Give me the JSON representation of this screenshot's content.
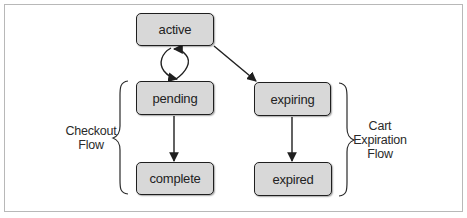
{
  "diagram": {
    "type": "state-flow",
    "colors": {
      "node_fill": "#d8d8d8",
      "node_border": "#1f1f1f",
      "edge": "#1f1f1f",
      "frame": "#b8b8b8",
      "text": "#222222"
    },
    "nodes": {
      "active": {
        "label": "active"
      },
      "pending": {
        "label": "pending"
      },
      "complete": {
        "label": "complete"
      },
      "expiring": {
        "label": "expiring"
      },
      "expired": {
        "label": "expired"
      }
    },
    "edges": [
      {
        "from": "active",
        "to": "pending",
        "style": "loop-bidirectional"
      },
      {
        "from": "active",
        "to": "expiring"
      },
      {
        "from": "pending",
        "to": "complete"
      },
      {
        "from": "expiring",
        "to": "expired"
      }
    ],
    "groups": {
      "checkout": {
        "line1": "Checkout",
        "line2": "Flow",
        "members": [
          "pending",
          "complete"
        ]
      },
      "cart_expiration": {
        "line1": "Cart",
        "line2": "Expiration",
        "line3": "Flow",
        "members": [
          "expiring",
          "expired"
        ]
      }
    }
  }
}
